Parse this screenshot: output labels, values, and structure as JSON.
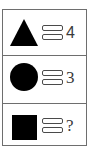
{
  "puzzle": {
    "rows": [
      {
        "shape": "triangle",
        "shape_color": "#000000",
        "operator": "equals-icon",
        "value": "4"
      },
      {
        "shape": "circle",
        "shape_color": "#000000",
        "operator": "equals-icon",
        "value": "3"
      },
      {
        "shape": "square",
        "shape_color": "#000000",
        "operator": "equals-icon",
        "value": "?"
      }
    ]
  }
}
